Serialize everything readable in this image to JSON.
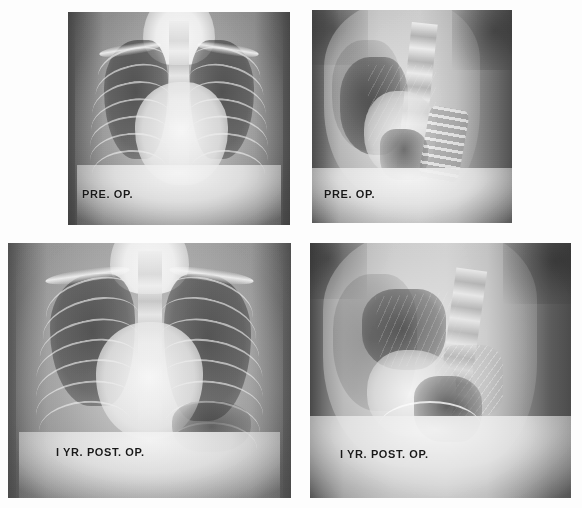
{
  "figure": {
    "kind": "radiograph-panel-figure",
    "background_color": "#fdfdfd",
    "rows": 2,
    "columns": 2,
    "label_color": "#1a1a1a"
  },
  "panels": [
    {
      "id": "top-left",
      "name": "preop-frontal",
      "label": "PRE. OP.",
      "view": "frontal",
      "timepoint": "pre-operative",
      "rect": {
        "x": 68,
        "y": 12,
        "w": 222,
        "h": 213
      },
      "label_pos": {
        "x": 14,
        "y": 176
      }
    },
    {
      "id": "top-right",
      "name": "preop-lateral",
      "label": "PRE. OP.",
      "view": "lateral",
      "timepoint": "pre-operative",
      "rect": {
        "x": 312,
        "y": 10,
        "w": 200,
        "h": 213
      },
      "label_pos": {
        "x": 12,
        "y": 178
      }
    },
    {
      "id": "bottom-left",
      "name": "postop-frontal",
      "label": "I YR. POST. OP.",
      "view": "frontal",
      "timepoint": "1 year post-operative",
      "rect": {
        "x": 8,
        "y": 243,
        "w": 283,
        "h": 255
      },
      "label_pos": {
        "x": 48,
        "y": 203
      }
    },
    {
      "id": "bottom-right",
      "name": "postop-lateral",
      "label": "I YR. POST. OP.",
      "view": "lateral",
      "timepoint": "1 year post-operative",
      "rect": {
        "x": 310,
        "y": 243,
        "w": 261,
        "h": 255
      },
      "label_pos": {
        "x": 30,
        "y": 205
      }
    }
  ]
}
